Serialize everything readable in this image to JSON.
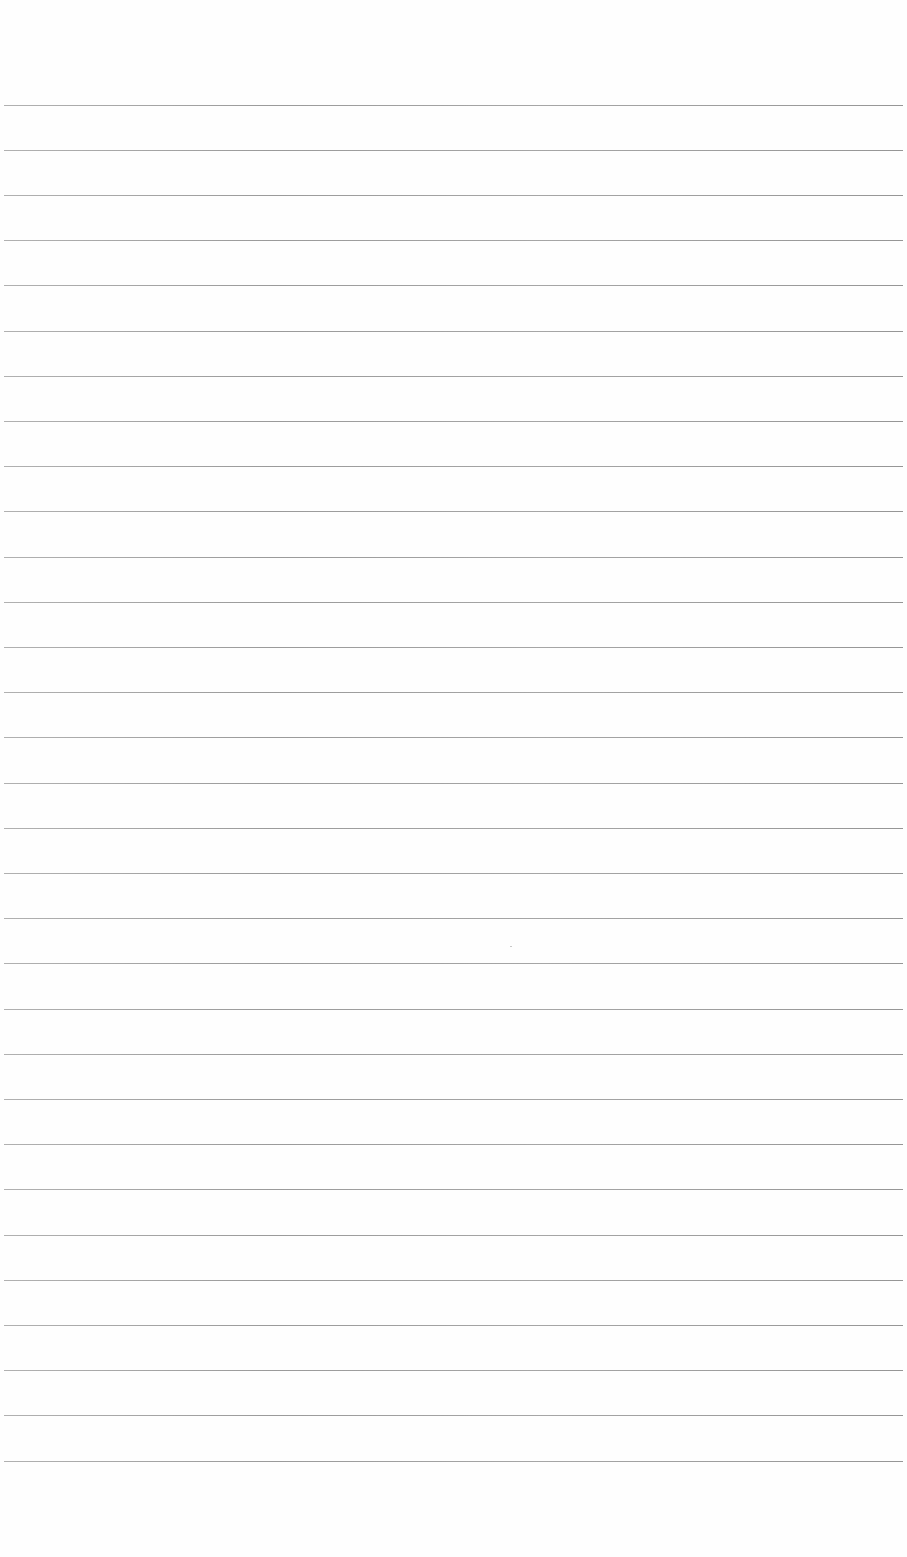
{
  "document": {
    "type": "lined-paper",
    "background_color": "#fefefe",
    "rule_color": "#9a9a9a",
    "rule_count": 31,
    "rule_start_y": 104.5,
    "rule_spacing": 45.2,
    "rule_left": 4,
    "rule_right": 903,
    "text_content": []
  }
}
